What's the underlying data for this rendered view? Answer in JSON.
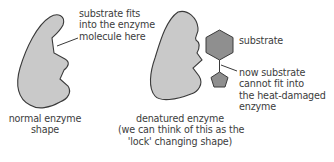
{
  "diagram": {
    "colors": {
      "enzyme_fill": "#c9c9c9",
      "substrate_fill": "#8f8f8f",
      "outline": "#3a3a3a",
      "text": "#3c3c3c"
    },
    "labels": {
      "active_site_line1": "substrate fits",
      "active_site_line2": "into the enzyme",
      "active_site_line3": "molecule here",
      "normal_line1": "normal enzyme",
      "normal_line2": "shape",
      "denatured_line1": "denatured enzyme",
      "denatured_line2": "(we can think of this as the",
      "denatured_line3": "'lock' changing shape)",
      "substrate": "substrate",
      "cannot_fit_line1": "now substrate",
      "cannot_fit_line2": "cannot fit into",
      "cannot_fit_line3": "the heat-damaged",
      "cannot_fit_line4": "enzyme"
    }
  }
}
